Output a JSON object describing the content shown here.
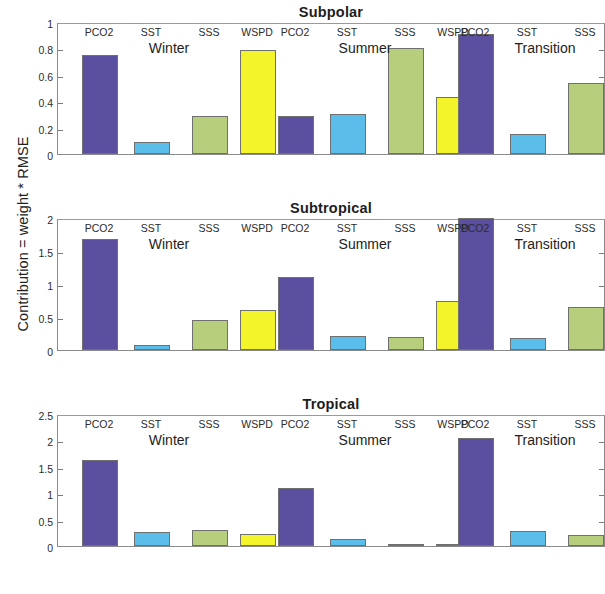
{
  "figure": {
    "ylabel": "Contribution = weight * RMSE",
    "categories": [
      "PCO2",
      "SST",
      "SSS",
      "WSPD"
    ],
    "groups": [
      "Winter",
      "Summer",
      "Transition"
    ],
    "series_colors": {
      "PCO2": "#5B50A0",
      "SST": "#5BBDEA",
      "SSS": "#B7CE7C",
      "WSPD": "#F4F42B"
    }
  },
  "chart_data": [
    {
      "type": "bar",
      "title": "Subpolar",
      "xlabel": "",
      "ylabel": "Contribution = weight * RMSE",
      "ylim": [
        0,
        1
      ],
      "yticks": [
        0,
        0.2,
        0.4,
        0.6,
        0.8,
        1
      ],
      "ytick_labels": [
        "0",
        "0.2",
        "0.4",
        "0.6",
        "0.8",
        "1"
      ],
      "grid": false,
      "legend": "none",
      "groups": [
        "Winter",
        "Summer",
        "Transition"
      ],
      "categories": [
        "PCO2",
        "SST",
        "SSS",
        "WSPD"
      ],
      "series": [
        {
          "name": "Winter",
          "values": [
            0.75,
            0.09,
            0.29,
            0.785
          ]
        },
        {
          "name": "Summer",
          "values": [
            0.29,
            0.3,
            0.8,
            0.43
          ]
        },
        {
          "name": "Transition",
          "values": [
            0.91,
            0.15,
            0.535,
            0.905
          ]
        }
      ]
    },
    {
      "type": "bar",
      "title": "Subtropical",
      "xlabel": "",
      "ylabel": "Contribution = weight * RMSE",
      "ylim": [
        0,
        2
      ],
      "yticks": [
        0,
        0.5,
        1,
        1.5,
        2
      ],
      "ytick_labels": [
        "0",
        "0.5",
        "1",
        "1.5",
        "2"
      ],
      "grid": false,
      "legend": "none",
      "groups": [
        "Winter",
        "Summer",
        "Transition"
      ],
      "categories": [
        "PCO2",
        "SST",
        "SSS",
        "WSPD"
      ],
      "series": [
        {
          "name": "Winter",
          "values": [
            1.68,
            0.07,
            0.45,
            0.61
          ]
        },
        {
          "name": "Summer",
          "values": [
            1.1,
            0.21,
            0.2,
            0.74
          ]
        },
        {
          "name": "Transition",
          "values": [
            2.0,
            0.18,
            0.645,
            0.645
          ]
        }
      ]
    },
    {
      "type": "bar",
      "title": "Tropical",
      "xlabel": "",
      "ylabel": "Contribution = weight * RMSE",
      "ylim": [
        0,
        2.5
      ],
      "yticks": [
        0,
        0.5,
        1,
        1.5,
        2,
        2.5
      ],
      "ytick_labels": [
        "0",
        "0.5",
        "1",
        "1.5",
        "2",
        "2.5"
      ],
      "grid": false,
      "legend": "none",
      "groups": [
        "Winter",
        "Summer",
        "Transition"
      ],
      "categories": [
        "PCO2",
        "SST",
        "SSS",
        "WSPD"
      ],
      "series": [
        {
          "name": "Winter",
          "values": [
            1.62,
            0.27,
            0.3,
            0.22
          ]
        },
        {
          "name": "Summer",
          "values": [
            1.1,
            0.13,
            0.015,
            0.02
          ]
        },
        {
          "name": "Transition",
          "values": [
            2.04,
            0.28,
            0.21,
            0.43
          ]
        }
      ]
    }
  ]
}
